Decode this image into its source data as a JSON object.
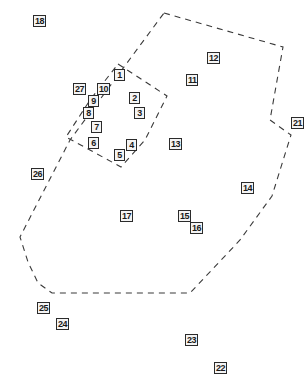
{
  "diagram": {
    "type": "numbered-region-map",
    "colors": {
      "background": "#ffffff",
      "outline": "#3a3a3a",
      "label_border": "#2b2b2b",
      "label_fill": "#f4f4f4",
      "label_text": "#1a1a1a"
    },
    "regions": [
      {
        "name": "outer-region",
        "style": "dashed",
        "points": "164,13 283,47 270,120 291,135 272,196 240,240 190,293 52,293 38,283 28,262 20,237 70,140 164,13"
      },
      {
        "name": "inner-region",
        "style": "dashed",
        "points": "118,64 167,96 145,140 121,167 66,137 90,100 118,64"
      }
    ],
    "labels": [
      {
        "id": "1",
        "text": "1",
        "x": 114,
        "y": 69
      },
      {
        "id": "2",
        "text": "2",
        "x": 129,
        "y": 92
      },
      {
        "id": "3",
        "text": "3",
        "x": 134,
        "y": 107
      },
      {
        "id": "4",
        "text": "4",
        "x": 126,
        "y": 139
      },
      {
        "id": "5",
        "text": "5",
        "x": 114,
        "y": 149
      },
      {
        "id": "6",
        "text": "6",
        "x": 88,
        "y": 137
      },
      {
        "id": "7",
        "text": "7",
        "x": 91,
        "y": 121
      },
      {
        "id": "8",
        "text": "8",
        "x": 83,
        "y": 107
      },
      {
        "id": "9",
        "text": "9",
        "x": 88,
        "y": 95
      },
      {
        "id": "10",
        "text": "10",
        "x": 97,
        "y": 83
      },
      {
        "id": "11",
        "text": "11",
        "x": 186,
        "y": 74
      },
      {
        "id": "12",
        "text": "12",
        "x": 207,
        "y": 52
      },
      {
        "id": "13",
        "text": "13",
        "x": 169,
        "y": 138
      },
      {
        "id": "14",
        "text": "14",
        "x": 241,
        "y": 182
      },
      {
        "id": "15",
        "text": "15",
        "x": 178,
        "y": 210
      },
      {
        "id": "16",
        "text": "16",
        "x": 190,
        "y": 222
      },
      {
        "id": "17",
        "text": "17",
        "x": 120,
        "y": 210
      },
      {
        "id": "18",
        "text": "18",
        "x": 33,
        "y": 15
      },
      {
        "id": "21",
        "text": "21",
        "x": 291,
        "y": 117
      },
      {
        "id": "22",
        "text": "22",
        "x": 214,
        "y": 362
      },
      {
        "id": "23",
        "text": "23",
        "x": 185,
        "y": 334
      },
      {
        "id": "24",
        "text": "24",
        "x": 56,
        "y": 318
      },
      {
        "id": "25",
        "text": "25",
        "x": 37,
        "y": 302
      },
      {
        "id": "26",
        "text": "26",
        "x": 31,
        "y": 168
      },
      {
        "id": "27",
        "text": "27",
        "x": 73,
        "y": 83
      }
    ]
  }
}
